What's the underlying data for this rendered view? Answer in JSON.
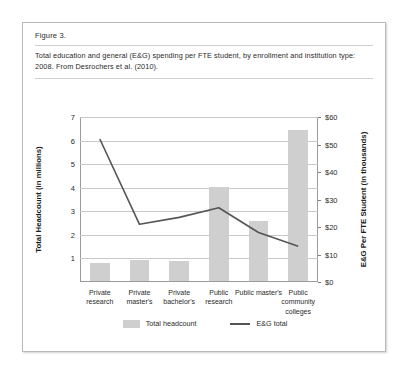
{
  "figure": {
    "label": "Figure 3.",
    "caption": "Total education and general (E&G) spending per FTE student, by enrollment and institution type: 2008. From Desrochers et al. (2010)."
  },
  "legend": {
    "bar_label": "Total headcount",
    "line_label": "E&G total"
  },
  "colors": {
    "bar_fill": "#cfcfcf",
    "line_stroke": "#555555",
    "gridline": "#c8c8c8",
    "axis": "#9a9a9a",
    "box_border": "#b9b9b9",
    "background": "#ffffff"
  },
  "chart_data": {
    "type": "bar",
    "title": "Total education and general (E&G) spending per FTE student, by enrollment and institution type: 2008",
    "xlabel": "",
    "ylabel": "Total Headcount (in millions)",
    "y2label": "E&G Per FTE Student (in thousands)",
    "categories": [
      "Private research",
      "Private master's",
      "Private bachelor's",
      "Public research",
      "Public master's",
      "Public community colleges"
    ],
    "series": [
      {
        "name": "Total headcount",
        "type": "bar",
        "axis": "left",
        "unit": "millions",
        "values": [
          0.75,
          0.9,
          0.85,
          4.0,
          2.55,
          6.4
        ]
      },
      {
        "name": "E&G total",
        "type": "line",
        "axis": "right",
        "unit": "thousands of dollars",
        "values": [
          52,
          21,
          23.5,
          27,
          18,
          13
        ]
      }
    ],
    "ylim": [
      0,
      7
    ],
    "yticks": [
      1,
      2,
      3,
      4,
      5,
      6,
      7
    ],
    "ytick_labels": [
      "1",
      "2",
      "3",
      "4",
      "5",
      "6",
      "7"
    ],
    "y2lim": [
      0,
      60
    ],
    "y2ticks": [
      0,
      10,
      20,
      30,
      40,
      50,
      60
    ],
    "y2tick_labels": [
      "$0",
      "$10",
      "$20",
      "$30",
      "$40",
      "$50",
      "$60"
    ],
    "grid": true,
    "legend_position": "bottom"
  }
}
